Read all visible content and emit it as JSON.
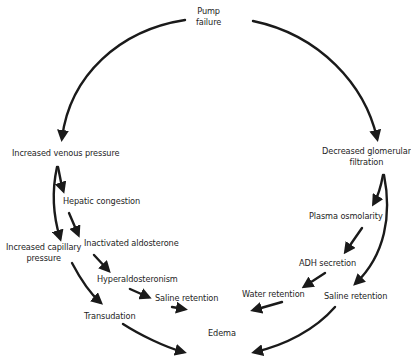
{
  "diagram": {
    "nodes": {
      "pump_failure": {
        "line1": "Pump",
        "line2": "failure"
      },
      "increased_venous_pressure": {
        "text": "Increased venous pressure"
      },
      "decreased_glomerular_filtration": {
        "line1": "Decreased glomerular",
        "line2": "filtration"
      },
      "hepatic_congestion": {
        "text": "Hepatic congestion"
      },
      "increased_capillary_pressure": {
        "line1": "Increased capillary",
        "line2": "pressure"
      },
      "inactivated_aldosterone": {
        "text": "Inactivated aldosterone"
      },
      "hyperaldosteronism": {
        "text": "Hyperaldosteronism"
      },
      "saline_retention_left": {
        "text": "Saline retention"
      },
      "transudation": {
        "text": "Transudation"
      },
      "edema": {
        "text": "Edema"
      },
      "plasma_osmolarity": {
        "text": "Plasma osmolarity"
      },
      "adh_secretion": {
        "text": "ADH secretion"
      },
      "water_retention": {
        "text": "Water retention"
      },
      "saline_retention_right": {
        "text": "Saline retention"
      }
    },
    "edges": [
      {
        "from": "Pump failure",
        "to": "Increased venous pressure"
      },
      {
        "from": "Pump failure",
        "to": "Decreased glomerular filtration"
      },
      {
        "from": "Increased venous pressure",
        "to": "Hepatic congestion"
      },
      {
        "from": "Increased venous pressure",
        "to": "Increased capillary pressure"
      },
      {
        "from": "Hepatic congestion",
        "to": "Inactivated aldosterone"
      },
      {
        "from": "Inactivated aldosterone",
        "to": "Hyperaldosteronism"
      },
      {
        "from": "Hyperaldosteronism",
        "to": "Saline retention"
      },
      {
        "from": "Saline retention",
        "to": "Edema"
      },
      {
        "from": "Increased capillary pressure",
        "to": "Transudation"
      },
      {
        "from": "Transudation",
        "to": "Edema"
      },
      {
        "from": "Decreased glomerular filtration",
        "to": "Plasma osmolarity"
      },
      {
        "from": "Decreased glomerular filtration",
        "to": "Saline retention"
      },
      {
        "from": "Plasma osmolarity",
        "to": "ADH secretion"
      },
      {
        "from": "ADH secretion",
        "to": "Water retention"
      },
      {
        "from": "Water retention",
        "to": "Edema"
      },
      {
        "from": "Saline retention",
        "to": "Edema"
      }
    ],
    "stroke_color": "#1a1a1a"
  }
}
